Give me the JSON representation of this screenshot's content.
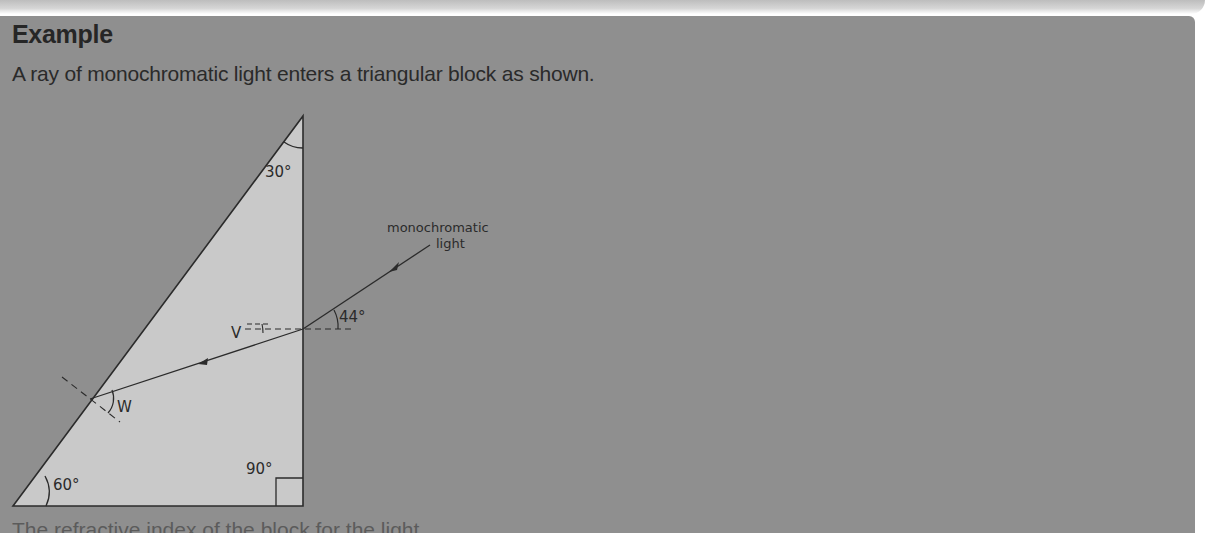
{
  "heading": "Example",
  "intro": "A ray of monochromatic light enters a triangular block as shown.",
  "next_line_partial": "The refractive index of the block for the light...",
  "diagram": {
    "labels": {
      "top_angle": "30°",
      "bottom_left_angle": "60°",
      "right_angle": "90°",
      "incidence_angle": "44°",
      "point_v": "V",
      "point_w": "W",
      "ray_label_line1": "monochromatic",
      "ray_label_line2": "light"
    },
    "colors": {
      "background": "#8f8f8f",
      "block_fill": "#c9c9c9",
      "line": "#2b2b2b"
    }
  }
}
